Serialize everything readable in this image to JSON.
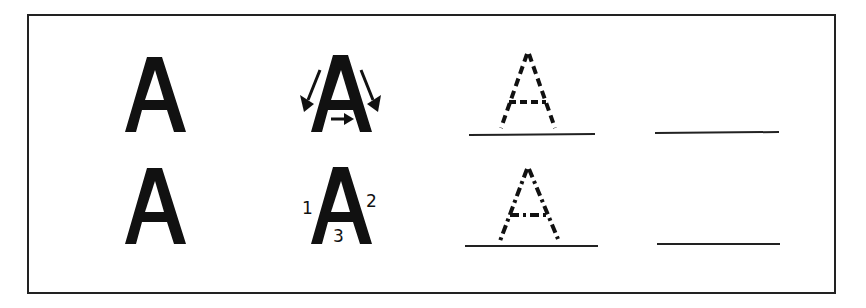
{
  "worksheet": {
    "letter": "A",
    "rows": [
      {
        "model_letter": "A",
        "stroke_guide": {
          "type": "arrows",
          "description": "direction arrows"
        },
        "tracing_letter": "A",
        "tracing_style": "dashed",
        "blank_line": ""
      },
      {
        "model_letter": "A",
        "stroke_guide": {
          "type": "numbers",
          "numbers": [
            "1",
            "2",
            "3"
          ]
        },
        "tracing_letter": "A",
        "tracing_style": "dash-dot",
        "blank_line": ""
      }
    ]
  }
}
